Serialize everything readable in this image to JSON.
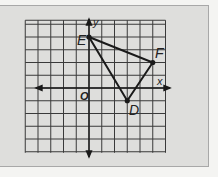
{
  "diagram": {
    "type": "coordinate-grid-triangle",
    "grid": {
      "x_min": -4,
      "x_max": 6,
      "y_min": -5,
      "y_max": 5,
      "cell_px": 12.75
    },
    "axes": {
      "x_label": "x",
      "y_label": "y",
      "origin_label": "O"
    },
    "triangle": {
      "vertices": [
        {
          "name": "E",
          "x": 0,
          "y": 4
        },
        {
          "name": "F",
          "x": 5,
          "y": 2
        },
        {
          "name": "D",
          "x": 3,
          "y": -1
        }
      ]
    },
    "colors": {
      "panel": "#dededc",
      "grid": "#333333",
      "line": "#1a1a1a"
    }
  }
}
